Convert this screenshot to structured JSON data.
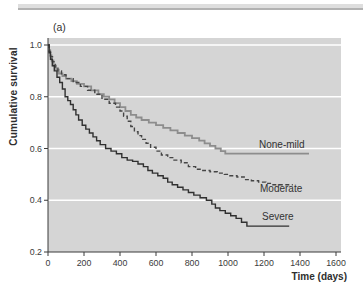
{
  "figure": {
    "panel_label": "(a)"
  },
  "chart_data": {
    "type": "line",
    "variant": "kaplan-meier-step-survival",
    "title": "",
    "panel_label": "(a)",
    "xlabel": "Time (days)",
    "ylabel": "Cumulative survival",
    "xlim": [
      0,
      1600
    ],
    "ylim": [
      0.2,
      1.0
    ],
    "x_ticks": [
      0,
      200,
      400,
      600,
      800,
      1000,
      1200,
      1400,
      1600
    ],
    "x_tick_labels": [
      "0",
      "200",
      "400",
      "600",
      "800",
      "1000",
      "1200",
      "1400",
      "1600"
    ],
    "y_ticks": [
      1.0,
      0.8,
      0.6,
      0.4,
      0.2
    ],
    "y_tick_labels": [
      "1.0",
      "0.8",
      "0.6",
      "0.4",
      "0.2"
    ],
    "gridlines_at": [
      1.0,
      0.8,
      0.6,
      0.4
    ],
    "grid": "horizontal white gridlines on light-gray plot background",
    "legend_position": "inline labels beside right ends of curves",
    "plot_bg_color": "#d5d5d5",
    "gridline_color": "#ffffff",
    "axis_color": "#3a3a3a",
    "series": [
      {
        "name": "None-mild",
        "line_style": "solid",
        "color": "#8d8d8d",
        "points": [
          [
            0,
            1.0
          ],
          [
            6,
            0.98
          ],
          [
            12,
            0.96
          ],
          [
            20,
            0.94
          ],
          [
            30,
            0.92
          ],
          [
            45,
            0.905
          ],
          [
            60,
            0.89
          ],
          [
            80,
            0.88
          ],
          [
            100,
            0.87
          ],
          [
            130,
            0.86
          ],
          [
            160,
            0.85
          ],
          [
            200,
            0.84
          ],
          [
            240,
            0.825
          ],
          [
            280,
            0.81
          ],
          [
            310,
            0.8
          ],
          [
            340,
            0.79
          ],
          [
            370,
            0.775
          ],
          [
            400,
            0.76
          ],
          [
            430,
            0.745
          ],
          [
            460,
            0.73
          ],
          [
            490,
            0.72
          ],
          [
            520,
            0.71
          ],
          [
            560,
            0.7
          ],
          [
            600,
            0.69
          ],
          [
            640,
            0.68
          ],
          [
            680,
            0.67
          ],
          [
            720,
            0.66
          ],
          [
            760,
            0.65
          ],
          [
            800,
            0.64
          ],
          [
            840,
            0.63
          ],
          [
            870,
            0.62
          ],
          [
            900,
            0.61
          ],
          [
            930,
            0.6
          ],
          [
            960,
            0.59
          ],
          [
            985,
            0.58
          ],
          [
            1450,
            0.58
          ]
        ]
      },
      {
        "name": "Moderate",
        "line_style": "dashed",
        "color": "#454545",
        "points": [
          [
            0,
            1.0
          ],
          [
            6,
            0.975
          ],
          [
            14,
            0.955
          ],
          [
            25,
            0.935
          ],
          [
            40,
            0.915
          ],
          [
            55,
            0.9
          ],
          [
            75,
            0.885
          ],
          [
            100,
            0.87
          ],
          [
            140,
            0.855
          ],
          [
            180,
            0.84
          ],
          [
            220,
            0.825
          ],
          [
            260,
            0.81
          ],
          [
            300,
            0.79
          ],
          [
            340,
            0.775
          ],
          [
            375,
            0.76
          ],
          [
            400,
            0.745
          ],
          [
            420,
            0.725
          ],
          [
            440,
            0.705
          ],
          [
            460,
            0.685
          ],
          [
            480,
            0.665
          ],
          [
            500,
            0.65
          ],
          [
            520,
            0.635
          ],
          [
            545,
            0.62
          ],
          [
            570,
            0.605
          ],
          [
            600,
            0.59
          ],
          [
            630,
            0.575
          ],
          [
            665,
            0.565
          ],
          [
            700,
            0.555
          ],
          [
            740,
            0.545
          ],
          [
            780,
            0.53
          ],
          [
            820,
            0.52
          ],
          [
            860,
            0.515
          ],
          [
            900,
            0.51
          ],
          [
            940,
            0.505
          ],
          [
            980,
            0.5
          ],
          [
            1010,
            0.495
          ],
          [
            1050,
            0.49
          ],
          [
            1090,
            0.48
          ],
          [
            1130,
            0.475
          ],
          [
            1170,
            0.47
          ],
          [
            1210,
            0.465
          ],
          [
            1250,
            0.46
          ],
          [
            1360,
            0.46
          ]
        ]
      },
      {
        "name": "Severe",
        "line_style": "solid",
        "color": "#303030",
        "points": [
          [
            0,
            1.0
          ],
          [
            6,
            0.97
          ],
          [
            14,
            0.945
          ],
          [
            24,
            0.92
          ],
          [
            35,
            0.9
          ],
          [
            50,
            0.875
          ],
          [
            65,
            0.855
          ],
          [
            80,
            0.83
          ],
          [
            95,
            0.8
          ],
          [
            110,
            0.785
          ],
          [
            125,
            0.77
          ],
          [
            140,
            0.75
          ],
          [
            155,
            0.73
          ],
          [
            170,
            0.71
          ],
          [
            190,
            0.69
          ],
          [
            210,
            0.675
          ],
          [
            230,
            0.66
          ],
          [
            250,
            0.645
          ],
          [
            270,
            0.63
          ],
          [
            290,
            0.615
          ],
          [
            320,
            0.6
          ],
          [
            350,
            0.59
          ],
          [
            380,
            0.58
          ],
          [
            410,
            0.565
          ],
          [
            440,
            0.555
          ],
          [
            470,
            0.55
          ],
          [
            500,
            0.54
          ],
          [
            530,
            0.53
          ],
          [
            555,
            0.515
          ],
          [
            580,
            0.505
          ],
          [
            610,
            0.495
          ],
          [
            640,
            0.485
          ],
          [
            665,
            0.47
          ],
          [
            690,
            0.46
          ],
          [
            720,
            0.45
          ],
          [
            750,
            0.44
          ],
          [
            780,
            0.43
          ],
          [
            810,
            0.42
          ],
          [
            845,
            0.41
          ],
          [
            880,
            0.4
          ],
          [
            910,
            0.385
          ],
          [
            930,
            0.37
          ],
          [
            955,
            0.36
          ],
          [
            985,
            0.35
          ],
          [
            1015,
            0.34
          ],
          [
            1045,
            0.33
          ],
          [
            1075,
            0.315
          ],
          [
            1105,
            0.3
          ],
          [
            1340,
            0.3
          ]
        ]
      }
    ]
  }
}
